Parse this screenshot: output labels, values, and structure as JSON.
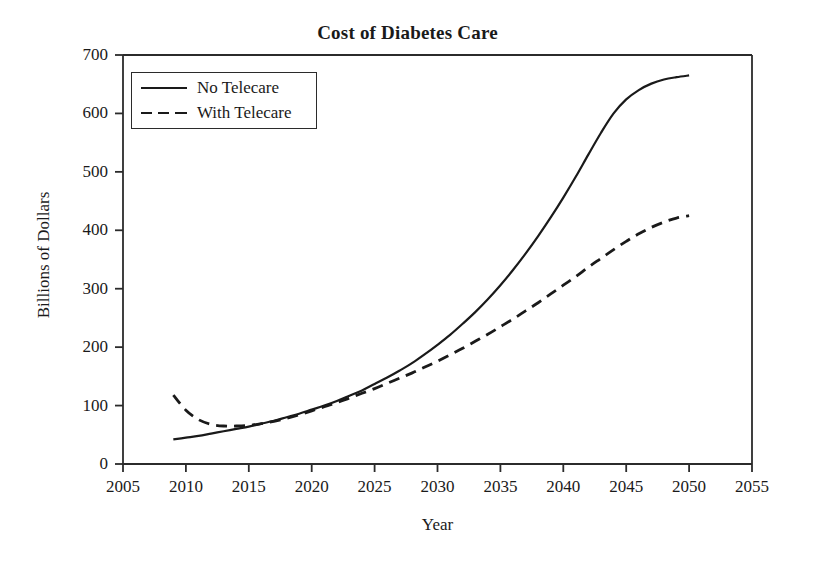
{
  "chart_data": {
    "type": "line",
    "title": "Cost of Diabetes Care",
    "xlabel": "Year",
    "ylabel": "Billions of Dollars",
    "xlim": [
      2005,
      2055
    ],
    "ylim": [
      0,
      700
    ],
    "xticks": [
      2005,
      2010,
      2015,
      2020,
      2025,
      2030,
      2035,
      2040,
      2045,
      2050,
      2055
    ],
    "yticks": [
      0,
      100,
      200,
      300,
      400,
      500,
      600,
      700
    ],
    "grid": false,
    "legend_position": "top-left",
    "x": [
      2009,
      2010,
      2011,
      2012,
      2013,
      2014,
      2015,
      2016,
      2017,
      2018,
      2019,
      2020,
      2021,
      2022,
      2023,
      2024,
      2025,
      2026,
      2027,
      2028,
      2029,
      2030,
      2031,
      2032,
      2033,
      2034,
      2035,
      2036,
      2037,
      2038,
      2039,
      2040,
      2041,
      2042,
      2043,
      2044,
      2045,
      2046,
      2047,
      2048,
      2049,
      2050
    ],
    "series": [
      {
        "name": "No Telecare",
        "style": "solid",
        "color": "#1a1a1a",
        "values": [
          42,
          45,
          48,
          52,
          56,
          60,
          64,
          69,
          74,
          80,
          86,
          93,
          100,
          108,
          117,
          126,
          137,
          148,
          160,
          173,
          188,
          204,
          221,
          240,
          260,
          282,
          306,
          332,
          360,
          390,
          422,
          456,
          492,
          530,
          567,
          600,
          624,
          640,
          651,
          658,
          662,
          665
        ]
      },
      {
        "name": "With Telecare",
        "style": "dashed",
        "color": "#1a1a1a",
        "values": [
          118,
          92,
          76,
          68,
          65,
          65,
          66,
          69,
          73,
          78,
          84,
          91,
          98,
          105,
          113,
          121,
          129,
          138,
          147,
          156,
          166,
          176,
          187,
          198,
          210,
          222,
          235,
          248,
          262,
          276,
          291,
          306,
          321,
          337,
          352,
          367,
          381,
          394,
          405,
          414,
          421,
          425
        ]
      }
    ]
  },
  "legend": {
    "items": [
      {
        "label": "No Telecare",
        "style": "solid"
      },
      {
        "label": "With Telecare",
        "style": "dashed"
      }
    ]
  }
}
